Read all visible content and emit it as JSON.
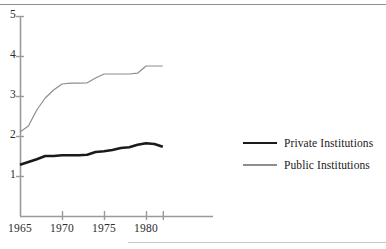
{
  "chart_data": {
    "type": "line",
    "title": "",
    "xlabel": "",
    "ylabel": "",
    "xlim": [
      1965,
      1982.5
    ],
    "ylim": [
      0,
      5
    ],
    "grid": false,
    "legend_position": "right",
    "x_ticks": [
      "1965",
      "1970",
      "1975",
      "1980"
    ],
    "x_tick_values": [
      1965,
      1970,
      1975,
      1980
    ],
    "x_minor_tick_values": [
      1982
    ],
    "y_ticks": [
      "1",
      "2",
      "3",
      "4",
      "5"
    ],
    "y_tick_values": [
      1,
      2,
      3,
      4,
      5
    ],
    "x": [
      1965,
      1966,
      1967,
      1968,
      1969,
      1970,
      1971,
      1972,
      1973,
      1974,
      1975,
      1976,
      1977,
      1978,
      1979,
      1980,
      1981,
      1982
    ],
    "series": [
      {
        "name": "Private Institutions",
        "color": "#1a1a1a",
        "width": 2.6,
        "values": [
          1.28,
          1.35,
          1.42,
          1.5,
          1.5,
          1.52,
          1.52,
          1.52,
          1.53,
          1.6,
          1.62,
          1.65,
          1.7,
          1.72,
          1.78,
          1.82,
          1.8,
          1.73
        ]
      },
      {
        "name": "Public Institutions",
        "color": "#8e8e8e",
        "width": 1.2,
        "values": [
          2.1,
          2.25,
          2.65,
          2.95,
          3.15,
          3.3,
          3.32,
          3.32,
          3.33,
          3.45,
          3.55,
          3.55,
          3.55,
          3.55,
          3.57,
          3.75,
          3.75,
          3.75
        ]
      }
    ]
  },
  "legend": {
    "entries": [
      {
        "label": "Private Institutions",
        "swatch": "thick-black-line-swatch"
      },
      {
        "label": "Public Institutions",
        "swatch": "thin-gray-line-swatch"
      }
    ]
  },
  "axes": {
    "y_labels": [
      "5",
      "4",
      "3",
      "2",
      "1"
    ],
    "x_labels": [
      "1965",
      "1970",
      "1975",
      "1980"
    ]
  }
}
